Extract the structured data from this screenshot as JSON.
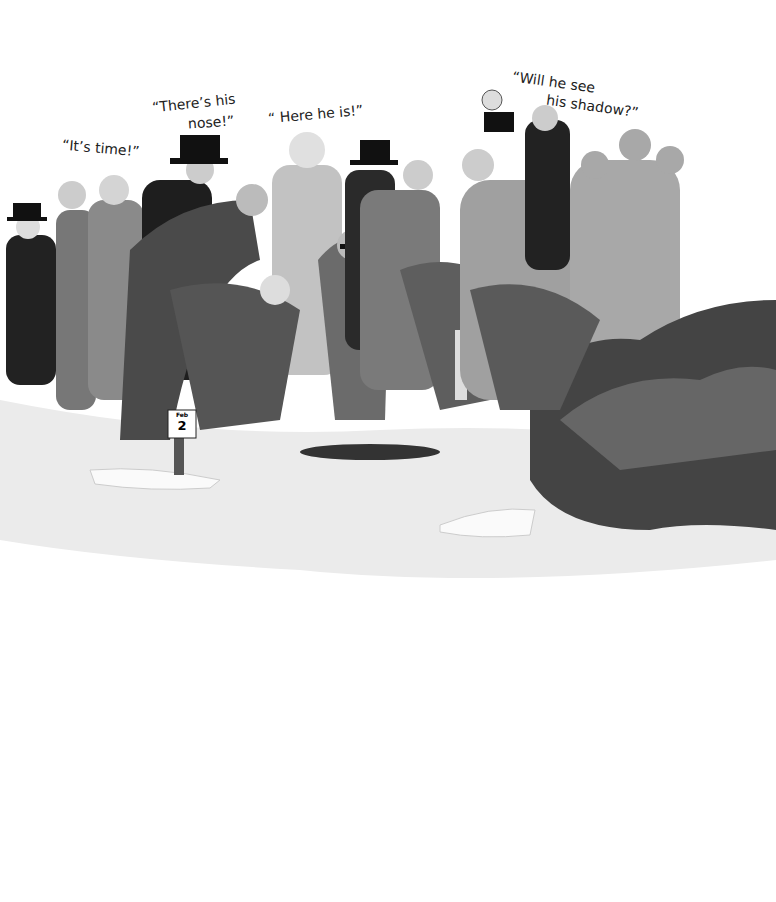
{
  "illustration": {
    "scene": "Crowd gathered in snow watching a groundhog hole",
    "quotes": [
      {
        "id": "q1",
        "text": "“It’s time!”",
        "x": 62,
        "y": 140,
        "rot": 5
      },
      {
        "id": "q2a",
        "text": "“There’s his",
        "x": 152,
        "y": 95,
        "rot": -6
      },
      {
        "id": "q2b",
        "text": "nose!”",
        "x": 188,
        "y": 114,
        "rot": -4
      },
      {
        "id": "q3",
        "text": "“ Here he is!”",
        "x": 268,
        "y": 106,
        "rot": -5
      },
      {
        "id": "q4a",
        "text": "“Will he see",
        "x": 512,
        "y": 74,
        "rot": 8
      },
      {
        "id": "q4b",
        "text": "his shadow?”",
        "x": 546,
        "y": 98,
        "rot": 8
      }
    ],
    "sign": {
      "label": "Feb",
      "number": "2"
    },
    "colors": {
      "snow": "#f2f2f2",
      "shadow": "#9a9a9a",
      "dark": "#1c1c1c",
      "mid": "#6e6e6e",
      "light": "#bdbdbd"
    }
  }
}
